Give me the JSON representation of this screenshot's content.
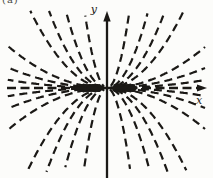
{
  "figure": {
    "corner_label": "(a)",
    "paper_color": "#fcfcfa",
    "ink_color": "#1b1916"
  },
  "axes": {
    "x_label": "x",
    "y_label": "y",
    "x_axis_style": "dashed line with solid arrowhead pointing right",
    "y_axis_style": "solid line with solid arrowhead pointing up"
  },
  "chart_data": {
    "type": "line",
    "equation": "y = c*x^2",
    "xlabel": "x",
    "ylabel": "y",
    "grid": false,
    "legend": null,
    "origin_px": {
      "x": 107,
      "y": 88
    },
    "clip_px": {
      "x1": 7,
      "y1": 10,
      "x2": 206,
      "y2": 172
    },
    "family": {
      "curves_per_quadrant": 7,
      "c_values_px": [
        0.00083,
        0.00208,
        0.00427,
        0.0131,
        0.0229,
        0.0455,
        0.153
      ],
      "quadrant_signs": [
        [
          -1,
          1
        ],
        [
          1,
          1
        ],
        [
          -1,
          -1
        ],
        [
          1,
          -1
        ]
      ],
      "x_start_px": 3,
      "x_end_px": 112
    },
    "dense_clusters_px": [
      {
        "cx": -17.5,
        "cy": 0
      },
      {
        "cx": 17.5,
        "cy": 0
      }
    ],
    "style": {
      "curve_dash": [
        8,
        5
      ],
      "curve_width": 2.2,
      "x_axis_dash": [
        9,
        4.5
      ],
      "x_axis_width": 2.5,
      "y_axis_width": 2.3
    }
  }
}
